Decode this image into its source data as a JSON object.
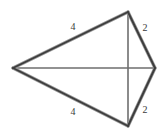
{
  "figure": {
    "type": "geometric-diagram",
    "background_color": "#ffffff",
    "canvas": {
      "width": 165,
      "height": 135
    },
    "stroke_colors": {
      "outline": "#3d3d3d",
      "outline_highlight": "#9a9a9a",
      "diagonal": "#6e6e6e"
    },
    "vertices": [
      {
        "id": "left",
        "name": "left-vertex",
        "x": 13,
        "y": 68
      },
      {
        "id": "top",
        "name": "top-vertex",
        "x": 128,
        "y": 12
      },
      {
        "id": "right",
        "name": "right-vertex",
        "x": 155,
        "y": 68
      },
      {
        "id": "bottom",
        "name": "bottom-vertex",
        "x": 128,
        "y": 126
      }
    ],
    "edges": [
      {
        "id": "left-top",
        "from": "left",
        "to": "top",
        "kind": "outline",
        "label": "4"
      },
      {
        "id": "top-right",
        "from": "top",
        "to": "right",
        "kind": "outline",
        "label": "2"
      },
      {
        "id": "right-bottom",
        "from": "right",
        "to": "bottom",
        "kind": "outline",
        "label": "2"
      },
      {
        "id": "bottom-left",
        "from": "bottom",
        "to": "left",
        "kind": "outline",
        "label": "4"
      }
    ],
    "diagonals": [
      {
        "id": "vertical-diagonal",
        "from": "top",
        "to": "bottom",
        "kind": "diagonal"
      },
      {
        "id": "horizontal-diagonal",
        "from": "left",
        "to": "right",
        "kind": "diagonal"
      }
    ],
    "labels": [
      {
        "id": "label-upper-left",
        "name": "edge-label-upper-left",
        "text": "4",
        "x": 73,
        "y": 27
      },
      {
        "id": "label-upper-right",
        "name": "edge-label-upper-right",
        "text": "2",
        "x": 145,
        "y": 28
      },
      {
        "id": "label-lower-left",
        "name": "edge-label-lower-left",
        "text": "4",
        "x": 73,
        "y": 112
      },
      {
        "id": "label-lower-right",
        "name": "edge-label-lower-right",
        "text": "2",
        "x": 145,
        "y": 110
      }
    ]
  }
}
